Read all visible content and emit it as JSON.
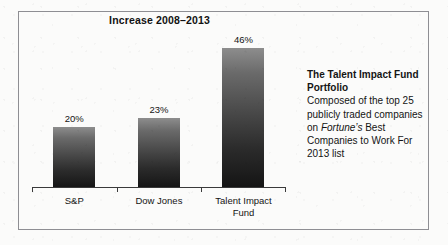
{
  "chart_data": {
    "type": "bar",
    "title": "Increase 2008–2013",
    "xlabel": "",
    "ylabel": "",
    "ylim": [
      0,
      52
    ],
    "grid": false,
    "legend": "none",
    "categories": [
      "S&P",
      "Dow Jones",
      "Talent Impact Fund"
    ],
    "category_lines": [
      [
        "S&P"
      ],
      [
        "Dow Jones"
      ],
      [
        "Talent Impact",
        "Fund"
      ]
    ],
    "values": [
      20,
      23,
      46
    ],
    "value_labels": [
      "20%",
      "23%",
      "46%"
    ],
    "units": "percent",
    "bar_color_top": "#8d8d8d",
    "bar_color_bottom": "#141414"
  },
  "frame": {
    "border_color": "#8e8e93"
  },
  "side_note": {
    "heading": "The Talent Impact Fund Portfolio",
    "body_before_italic": "Composed of the top 25 publicly traded companies on ",
    "italic_term": "Fortune’s",
    "body_after_italic": " Best Companies to Work For 2013 list"
  }
}
